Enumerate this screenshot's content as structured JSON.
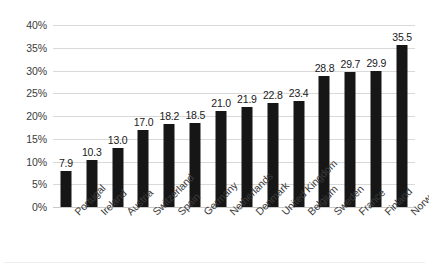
{
  "chart_data": {
    "type": "bar",
    "title": "",
    "xlabel": "",
    "ylabel": "",
    "ylim": [
      0,
      40
    ],
    "grid": true,
    "legend": null,
    "bar_color": "#161616",
    "gridline_color": "#d9d9d9",
    "y_tick_suffix": "%",
    "y_ticks": [
      "0%",
      "5%",
      "10%",
      "15%",
      "20%",
      "25%",
      "30%",
      "35%",
      "40%"
    ],
    "y_tick_values": [
      0,
      5,
      10,
      15,
      20,
      25,
      30,
      35,
      40
    ],
    "categories": [
      "Portugal",
      "Ireland",
      "Austria",
      "Switzerland",
      "Spain",
      "Germany",
      "Netherlands",
      "Denmark",
      "United Kingdom",
      "Belgium",
      "Sweden",
      "France",
      "Finland",
      "Norway"
    ],
    "values": [
      7.9,
      10.3,
      13.0,
      17.0,
      18.2,
      18.5,
      21.0,
      21.9,
      22.8,
      23.4,
      28.8,
      29.7,
      29.9,
      35.5
    ],
    "data_labels": [
      "7.9",
      "10.3",
      "13.0",
      "17.0",
      "18.2",
      "18.5",
      "21.0",
      "21.9",
      "22.8",
      "23.4",
      "28.8",
      "29.7",
      "29.9",
      "35.5"
    ]
  }
}
